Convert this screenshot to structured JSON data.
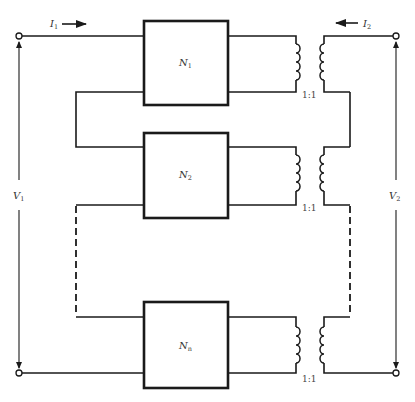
{
  "diagram": {
    "type": "series connection of two-port networks with ideal transformers",
    "networks": [
      {
        "name": "N",
        "subscript": "1"
      },
      {
        "name": "N",
        "subscript": "2"
      },
      {
        "name": "N",
        "subscript": "n"
      }
    ],
    "transformers": [
      {
        "ratio": "1:1"
      },
      {
        "ratio": "1:1"
      },
      {
        "ratio": "1:1"
      }
    ],
    "port1": {
      "current": {
        "name": "I",
        "subscript": "1"
      },
      "voltage": {
        "name": "V",
        "subscript": "1"
      }
    },
    "port2": {
      "current": {
        "name": "I",
        "subscript": "2"
      },
      "voltage": {
        "name": "V",
        "subscript": "2"
      }
    },
    "colors": {
      "line": "#1a1a1a",
      "background": "#ffffff"
    }
  }
}
